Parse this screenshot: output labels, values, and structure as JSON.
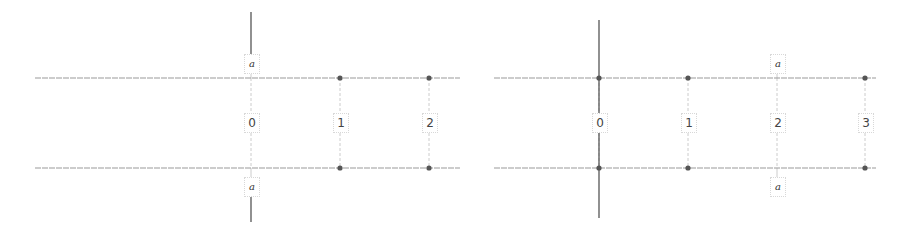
{
  "colors": {
    "line": "#9a9a9a",
    "axis": "#555555",
    "dot": "#555555",
    "guide": "#cccccc",
    "text": "#444444"
  },
  "panels": [
    {
      "name": "left",
      "rows_y": [
        78,
        168
      ],
      "line_x": [
        35,
        460
      ],
      "axis_x": 251,
      "axis_segments": [
        [
          12,
          56
        ],
        [
          196,
          222
        ]
      ],
      "dots_x": [
        340,
        429
      ],
      "labels": [
        {
          "text": "0",
          "x": 251,
          "y": 122
        },
        {
          "text": "1",
          "x": 340,
          "y": 122
        },
        {
          "text": "2",
          "x": 429,
          "y": 122
        }
      ],
      "a_labels": [
        {
          "text": "a",
          "x": 251,
          "y": 63
        },
        {
          "text": "a",
          "x": 251,
          "y": 186
        }
      ]
    },
    {
      "name": "right",
      "rows_y": [
        78,
        168
      ],
      "line_x": [
        494,
        876
      ],
      "axis_x": 599,
      "axis_segments": [
        [
          20,
          218
        ]
      ],
      "dots_x": [
        599,
        688,
        865
      ],
      "labels": [
        {
          "text": "0",
          "x": 599,
          "y": 122
        },
        {
          "text": "1",
          "x": 688,
          "y": 122
        },
        {
          "text": "2",
          "x": 777,
          "y": 122
        },
        {
          "text": "3",
          "x": 865,
          "y": 122
        }
      ],
      "a_labels": [
        {
          "text": "a",
          "x": 777,
          "y": 63
        },
        {
          "text": "a",
          "x": 777,
          "y": 186
        }
      ]
    }
  ]
}
